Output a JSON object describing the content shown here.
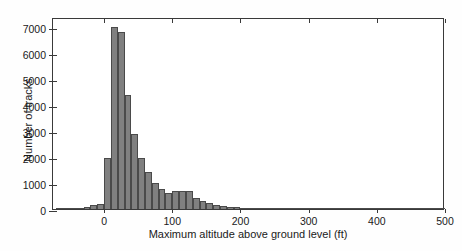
{
  "chart_data": {
    "type": "bar",
    "title": "",
    "subtitle": "",
    "xlabel": "Maximum altitude above ground level (ft)",
    "ylabel": "Number of tracks",
    "xlim": [
      -75,
      500
    ],
    "ylim": [
      0,
      7400
    ],
    "xticks": [
      0,
      100,
      200,
      300,
      400,
      500
    ],
    "xticklabels": [
      "0",
      "100",
      "200",
      "300",
      "400",
      "500"
    ],
    "yticks": [
      0,
      1000,
      2000,
      3000,
      4000,
      5000,
      6000,
      7000
    ],
    "yticklabels": [
      "0",
      "1000",
      "2000",
      "3000",
      "4000",
      "5000",
      "6000",
      "7000"
    ],
    "grid": false,
    "legend": null,
    "bin_width": 10,
    "bar_color": "#808080",
    "bar_edge_color": "#4a4a4a",
    "background_color": "#ffffff",
    "axis_color": "#3a3a3a",
    "bin_starts": [
      -70,
      -60,
      -50,
      -40,
      -30,
      -20,
      -10,
      0,
      10,
      20,
      30,
      40,
      50,
      60,
      70,
      80,
      90,
      100,
      110,
      120,
      130,
      140,
      150,
      160,
      170,
      180,
      190,
      200,
      210,
      220,
      230,
      240,
      250,
      260,
      270,
      280,
      290,
      300,
      310,
      320,
      330,
      340,
      350,
      360,
      370,
      380,
      390,
      400,
      410,
      420,
      430,
      440,
      450,
      460,
      470,
      480,
      490
    ],
    "values": [
      20,
      30,
      40,
      55,
      70,
      140,
      180,
      1960,
      7020,
      6820,
      4380,
      2890,
      1980,
      1440,
      1000,
      780,
      620,
      700,
      690,
      690,
      430,
      300,
      230,
      160,
      110,
      80,
      60,
      50,
      45,
      40,
      35,
      32,
      30,
      28,
      25,
      22,
      20,
      18,
      17,
      16,
      15,
      14,
      13,
      12,
      11,
      10,
      10,
      9,
      9,
      8,
      8,
      7,
      7,
      6,
      6,
      5,
      5
    ],
    "peak_value": 7020,
    "peak_bin": 10,
    "total_bins": 57
  }
}
